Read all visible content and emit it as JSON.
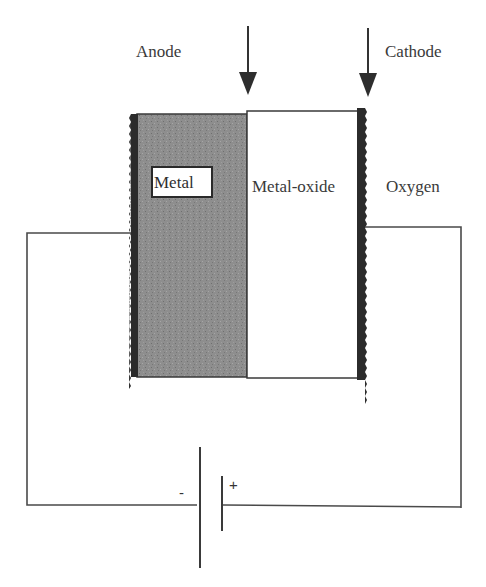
{
  "diagram": {
    "labels": {
      "anode": "Anode",
      "cathode": "Cathode",
      "metal": "Metal",
      "metal_oxide": "Metal-oxide",
      "oxygen": "Oxygen",
      "battery_negative": "-",
      "battery_positive": "+"
    },
    "components": {
      "anode_arrow": "down-arrow",
      "cathode_arrow": "down-arrow",
      "metal_layer": "shaded rectangle",
      "metal_oxide_layer": "white rectangle",
      "anode_electrode": "dark jagged strip (left)",
      "cathode_electrode": "dark jagged strip (right)",
      "battery": "DC source (long plate negative, short plate positive)",
      "wires": "external circuit connecting anode and cathode through battery"
    },
    "colors": {
      "metal_fill": "#8a8a8a",
      "electrode": "#2b2b2b",
      "line": "#444444",
      "background": "#ffffff"
    }
  }
}
